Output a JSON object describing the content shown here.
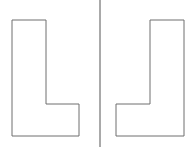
{
  "figure": {
    "colors": {
      "background": "#ffffff",
      "shape_stroke": "#6e6e6e",
      "divider": "#555555"
    },
    "left_shape": {
      "name": "L-shape",
      "points": "12,20 46,20 46,104 79,104 79,136 12,136"
    },
    "right_shape": {
      "name": "mirrored-L-shape",
      "points": "150,20 184,20 184,136 116,136 116,104 150,104"
    },
    "divider": {
      "x": 100
    }
  }
}
